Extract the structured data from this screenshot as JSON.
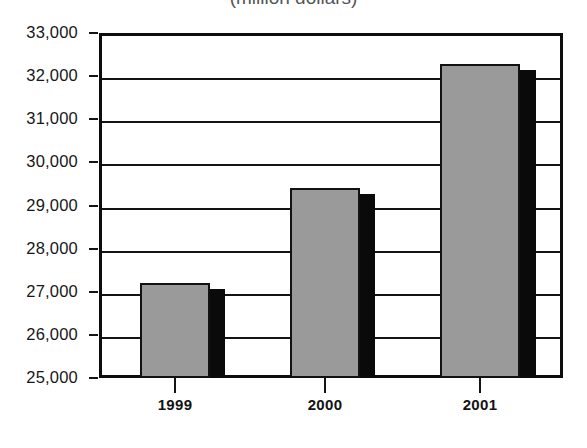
{
  "chart_data": {
    "type": "bar",
    "title": "(million dollars)",
    "title_note": "title clipped at top edge of image",
    "xlabel": "",
    "ylabel": "",
    "categories": [
      "1999",
      "2000",
      "2001"
    ],
    "values": [
      27200,
      29400,
      32280
    ],
    "ylim": [
      25000,
      33000
    ],
    "yticks": [
      25000,
      26000,
      27000,
      28000,
      29000,
      30000,
      31000,
      32000,
      33000
    ],
    "ytick_labels": [
      "25,000",
      "26,000",
      "27,000",
      "28,000",
      "29,000",
      "30,000",
      "31,000",
      "32,000",
      "33,000"
    ],
    "grid": true,
    "legend": null,
    "series": [
      {
        "name": "value",
        "values": [
          27200,
          29400,
          32280
        ]
      }
    ],
    "colors": {
      "bar_face": "#9a9a9a",
      "bar_shadow": "#0a0a0a",
      "axis": "#141414",
      "background": "#ffffff"
    }
  },
  "axis": {
    "y_labels": [
      "33,000",
      "32,000",
      "31,000",
      "30,000",
      "29,000",
      "28,000",
      "27,000",
      "26,000",
      "25,000"
    ],
    "x_labels": [
      "1999",
      "2000",
      "2001"
    ]
  }
}
